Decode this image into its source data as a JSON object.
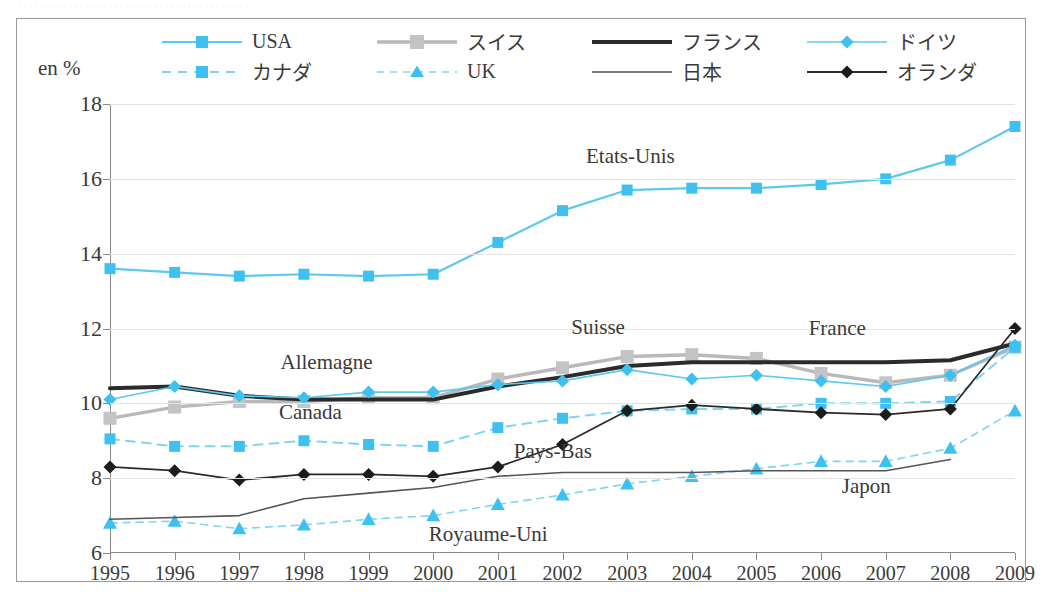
{
  "top_cut_text": "··········································",
  "axis": {
    "y_unit_label": "en %",
    "y_ticks": [
      "6",
      "8",
      "10",
      "12",
      "14",
      "16",
      "18"
    ],
    "x_ticks": [
      "1995",
      "1996",
      "1997",
      "1998",
      "1999",
      "2000",
      "2001",
      "2002",
      "2003",
      "2004",
      "2005",
      "2006",
      "2007",
      "2008",
      "2009"
    ]
  },
  "legend": {
    "row1": [
      {
        "label": "USA",
        "key": "usa-legend-key",
        "color": "#5ec8ef",
        "marker": "square",
        "dash": "solid",
        "width": 2.2
      },
      {
        "label": "スイス",
        "key": "suisse-legend-key",
        "color": "#b9b9b9",
        "marker": "square",
        "dash": "solid",
        "width": 3.4
      },
      {
        "label": "フランス",
        "key": "france-legend-key",
        "color": "#2b2b2b",
        "marker": "none",
        "dash": "solid",
        "width": 4.0
      },
      {
        "label": "ドイツ",
        "key": "allemagne-legend-key",
        "color": "#5ec8ef",
        "marker": "diamond",
        "dash": "solid",
        "width": 1.6
      }
    ],
    "row2": [
      {
        "label": "カナダ",
        "key": "canada-legend-key",
        "color": "#7fd4f2",
        "marker": "square",
        "dash": "dashed",
        "width": 2.0
      },
      {
        "label": "UK",
        "key": "uk-legend-key",
        "color": "#7fd4f2",
        "marker": "triangle",
        "dash": "dashed",
        "width": 1.6
      },
      {
        "label": "日本",
        "key": "japon-legend-key",
        "color": "#555555",
        "marker": "none",
        "dash": "solid",
        "width": 1.6
      },
      {
        "label": "オランダ",
        "key": "paysbas-legend-key",
        "color": "#2b2b2b",
        "marker": "diamond",
        "dash": "solid",
        "width": 1.8
      }
    ]
  },
  "annotations": [
    {
      "name": "annotation-etats-unis",
      "text": "Etats-Unis",
      "year": 2003.05,
      "value": 16.62
    },
    {
      "name": "annotation-suisse",
      "text": "Suisse",
      "year": 2002.55,
      "value": 12.05
    },
    {
      "name": "annotation-allemagne",
      "text": "Allemagne",
      "year": 1998.35,
      "value": 11.1
    },
    {
      "name": "annotation-canada",
      "text": "Canada",
      "year": 1998.1,
      "value": 9.78
    },
    {
      "name": "annotation-france",
      "text": "France",
      "year": 2006.25,
      "value": 12.02
    },
    {
      "name": "annotation-pays-bas",
      "text": "Pays-Bas",
      "year": 2001.85,
      "value": 8.72
    },
    {
      "name": "annotation-japon",
      "text": "Japon",
      "year": 2006.7,
      "value": 7.78
    },
    {
      "name": "annotation-royaume-uni",
      "text": "Royaume-Uni",
      "year": 2000.85,
      "value": 6.52
    }
  ],
  "chart_data": {
    "type": "line",
    "title": "",
    "xlabel": "",
    "ylabel": "en %",
    "xlim": [
      1995,
      2009
    ],
    "ylim": [
      6,
      18
    ],
    "ytick_step": 2,
    "grid": true,
    "legend_position": "top",
    "x": [
      1995,
      1996,
      1997,
      1998,
      1999,
      2000,
      2001,
      2002,
      2003,
      2004,
      2005,
      2006,
      2007,
      2008,
      2009
    ],
    "series": [
      {
        "name": "USA",
        "fr_name": "Etats-Unis",
        "jp_name": "USA",
        "color": "#5ec8ef",
        "marker": "square",
        "dash": "solid",
        "width": 2.2,
        "values": [
          13.6,
          13.5,
          13.4,
          13.45,
          13.4,
          13.45,
          14.3,
          15.15,
          15.7,
          15.75,
          15.75,
          15.85,
          16.0,
          16.5,
          17.4
        ]
      },
      {
        "name": "スイス",
        "fr_name": "Suisse",
        "jp_name": "スイス",
        "color": "#b9b9b9",
        "marker": "square",
        "dash": "solid",
        "width": 3.4,
        "values": [
          9.6,
          9.9,
          10.05,
          10.05,
          10.15,
          10.15,
          10.65,
          10.95,
          11.25,
          11.3,
          11.2,
          10.8,
          10.55,
          10.75,
          11.5
        ]
      },
      {
        "name": "フランス",
        "fr_name": "France",
        "jp_name": "フランス",
        "color": "#2b2b2b",
        "marker": "none",
        "dash": "solid",
        "width": 4.0,
        "values": [
          10.4,
          10.45,
          10.2,
          10.1,
          10.1,
          10.1,
          10.45,
          10.7,
          11.0,
          11.1,
          11.1,
          11.1,
          11.1,
          11.15,
          11.6
        ]
      },
      {
        "name": "ドイツ",
        "fr_name": "Allemagne",
        "jp_name": "ドイツ",
        "color": "#5ec8ef",
        "marker": "diamond",
        "dash": "solid",
        "width": 1.6,
        "values": [
          10.1,
          10.45,
          10.2,
          10.15,
          10.3,
          10.3,
          10.5,
          10.6,
          10.9,
          10.65,
          10.75,
          10.6,
          10.45,
          10.75,
          11.55
        ]
      },
      {
        "name": "カナダ",
        "fr_name": "Canada",
        "jp_name": "カナダ",
        "color": "#7fd4f2",
        "marker": "square",
        "dash": "dashed",
        "width": 2.0,
        "values": [
          9.05,
          8.85,
          8.85,
          9.0,
          8.9,
          8.85,
          9.35,
          9.6,
          9.8,
          9.85,
          9.85,
          10.0,
          10.0,
          10.05,
          11.5
        ]
      },
      {
        "name": "UK",
        "fr_name": "Royaume-Uni",
        "jp_name": "UK",
        "color": "#7fd4f2",
        "marker": "triangle",
        "dash": "dashed",
        "width": 1.6,
        "values": [
          6.8,
          6.85,
          6.65,
          6.75,
          6.9,
          7.0,
          7.3,
          7.55,
          7.85,
          8.05,
          8.25,
          8.45,
          8.45,
          8.8,
          9.8
        ]
      },
      {
        "name": "日本",
        "fr_name": "Japon",
        "jp_name": "日本",
        "color": "#555555",
        "marker": "none",
        "dash": "solid",
        "width": 1.6,
        "values": [
          6.9,
          6.95,
          7.0,
          7.45,
          7.6,
          7.75,
          8.05,
          8.15,
          8.15,
          8.15,
          8.2,
          8.2,
          8.2,
          8.5,
          null
        ]
      },
      {
        "name": "オランダ",
        "fr_name": "Pays-Bas",
        "jp_name": "オランダ",
        "color": "#2b2b2b",
        "marker": "diamond",
        "dash": "solid",
        "width": 1.8,
        "values": [
          8.3,
          8.2,
          7.95,
          8.1,
          8.1,
          8.05,
          8.3,
          8.9,
          9.8,
          9.95,
          9.85,
          9.75,
          9.7,
          9.85,
          12.0
        ]
      }
    ]
  }
}
